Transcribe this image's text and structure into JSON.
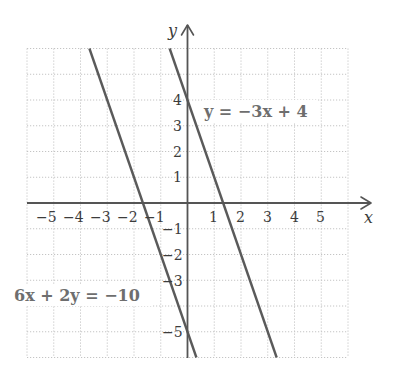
{
  "chart_data": {
    "type": "line",
    "title": "",
    "xlabel": "x",
    "ylabel": "y",
    "xlim": [
      -6,
      6
    ],
    "ylim": [
      -6,
      6
    ],
    "grid": true,
    "grid_style": "dotted",
    "x_tick_labels": [
      "-5",
      "-4",
      "-3",
      "-2",
      "-1",
      "1",
      "2",
      "3",
      "4",
      "5"
    ],
    "x_tick_values": [
      -5,
      -4,
      -3,
      -2,
      -1,
      1,
      2,
      3,
      4,
      5
    ],
    "y_tick_labels": [
      "4",
      "3",
      "2",
      "1",
      "-1",
      "-2",
      "-3",
      "-5"
    ],
    "y_tick_values": [
      4,
      3,
      2,
      1,
      -1,
      -2,
      -3,
      -5
    ],
    "series": [
      {
        "name": "6x + 2y = -10",
        "equation": "y = -3x - 5",
        "slope": -3,
        "intercept": -5,
        "x": [
          -3.667,
          0.333
        ],
        "y": [
          6,
          -6
        ],
        "color": "#5a5a5a"
      },
      {
        "name": "y = -3x + 4",
        "equation": "y = -3x + 4",
        "slope": -3,
        "intercept": 4,
        "x": [
          -0.667,
          3.333
        ],
        "y": [
          6,
          -6
        ],
        "color": "#5a5a5a"
      }
    ],
    "annotations": [
      {
        "text": "y = −3x + 4",
        "x": 0.7,
        "y": 3.6
      },
      {
        "text": "6x + 2y = −10",
        "x": -6.5,
        "y": -3.7
      }
    ]
  },
  "labels": {
    "x_axis": "x",
    "y_axis": "y",
    "eq1": "y = −3x + 4",
    "eq2": "6x + 2y = −10",
    "x_ticks": [
      "−5",
      "−4",
      "−3",
      "−2",
      "−1",
      "1",
      "2",
      "3",
      "4",
      "5"
    ],
    "y_ticks_pos": [
      "4",
      "3",
      "2",
      "1"
    ],
    "y_ticks_neg": [
      "−1",
      "−2",
      "−3",
      "−5"
    ]
  },
  "colors": {
    "grid": "#c4c4c4",
    "axis": "#555555",
    "line": "#5a5a5a",
    "label": "#6e6e6e"
  }
}
